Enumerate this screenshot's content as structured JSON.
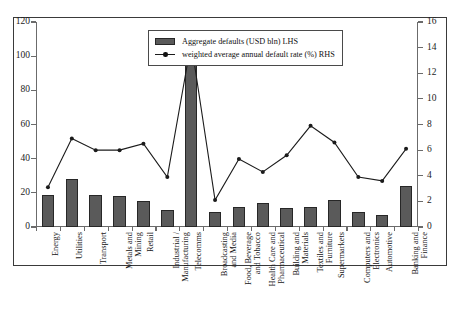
{
  "chart_data": {
    "type": "bar",
    "title": "",
    "subtitle": "",
    "xlabel": "",
    "ylabel": "",
    "grid": false,
    "legend_position": "top-center",
    "categories": [
      "Energy",
      "Utilities",
      "Transport",
      "Metals and Mining",
      "Retail",
      "Industrial / Manufacturing",
      "Telecomms",
      "Broadcasting and Media",
      "Food, Beverage and Tobacco",
      "Health Care and Pharmaceutical",
      "Building and Materials",
      "Textiles and Furniture",
      "Supermarkets",
      "Computers and Electronics",
      "Automotive",
      "Banking and Finance"
    ],
    "category_lines": [
      [
        "Energy"
      ],
      [
        "Utilities"
      ],
      [
        "Transport"
      ],
      [
        "Metals and",
        "Mining"
      ],
      [
        "Retail"
      ],
      [
        "Industrial /",
        "Manufacturing"
      ],
      [
        "Telecomms"
      ],
      [
        "Broadcasting",
        "and Media"
      ],
      [
        "Food, Beverage",
        "and Tobacco"
      ],
      [
        "Health Care and",
        "Pharmaceutical"
      ],
      [
        "Building and",
        "Materials"
      ],
      [
        "Textiles and",
        "Furniture"
      ],
      [
        "Supermarkets"
      ],
      [
        "Computers and",
        "Electronics"
      ],
      [
        "Automotive"
      ],
      [
        "Banking and",
        "Finance"
      ]
    ],
    "series": [
      {
        "name": "Aggregate defaults (USD bln) LHS",
        "type": "bar",
        "axis": "left",
        "color": "#5a5a5a",
        "values": [
          19,
          28,
          19,
          18,
          15,
          10,
          110,
          9,
          12,
          14,
          11,
          12,
          16,
          9,
          7,
          24
        ]
      },
      {
        "name": "weighted average annual default rate (%) RHS",
        "type": "line",
        "axis": "right",
        "color": "#1b1b1b",
        "values": [
          3.1,
          6.9,
          6.0,
          6.0,
          6.5,
          3.9,
          14.4,
          2.1,
          5.3,
          4.3,
          5.6,
          7.9,
          6.6,
          3.9,
          3.6,
          6.1
        ]
      }
    ],
    "left_axis": {
      "label": "Aggregate defaults (USD bln)",
      "min": 0,
      "max": 120,
      "ticks": [
        0,
        20,
        40,
        60,
        80,
        100,
        120
      ]
    },
    "right_axis": {
      "label": "weighted average annual default rate (%)",
      "min": 0,
      "max": 16,
      "ticks": [
        0,
        2,
        4,
        6,
        8,
        10,
        12,
        14,
        16
      ]
    },
    "legend": [
      "Aggregate defaults (USD bln) LHS",
      "weighted average annual default rate (%) RHS"
    ]
  }
}
